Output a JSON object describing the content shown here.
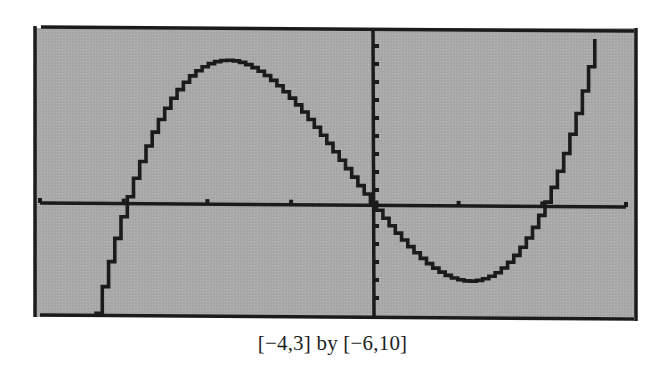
{
  "caption": "[−4,3] by [−6,10]",
  "colors": {
    "screen_bg": "#a9a9a9",
    "ink": "#1b1b1b",
    "page_bg": "#ffffff"
  },
  "chart_data": {
    "type": "line",
    "title": "",
    "caption": "[−4,3] by [−6,10]",
    "function": "y = x^3 + x^2 - 6x",
    "xlabel": "",
    "ylabel": "",
    "xlim": [
      -4,
      3
    ],
    "ylim": [
      -6,
      10
    ],
    "xscale_ticks": [
      -4,
      -3,
      -2,
      -1,
      0,
      1,
      2,
      3
    ],
    "yscale_ticks": [
      -6,
      -5,
      -4,
      -3,
      -2,
      -1,
      0,
      1,
      2,
      3,
      4,
      5,
      6,
      7,
      8,
      9,
      10
    ],
    "tick_labels_shown": false,
    "grid": false,
    "legend": null,
    "features": {
      "x_intercepts": [
        -3,
        0,
        2
      ],
      "local_max": {
        "x": -1.79,
        "y": 8.21
      },
      "local_min": {
        "x": 1.12,
        "y": -4.06
      }
    },
    "series": [
      {
        "name": "f(x)",
        "x": [
          -3.34,
          -3.0,
          -2.5,
          -2.0,
          -1.79,
          -1.5,
          -1.0,
          -0.5,
          0.0,
          0.5,
          1.0,
          1.12,
          1.5,
          2.0,
          2.5,
          2.66
        ],
        "y": [
          -6.06,
          0.0,
          5.63,
          8.0,
          8.21,
          7.88,
          6.0,
          3.13,
          0.0,
          -2.63,
          -4.0,
          -4.06,
          -3.38,
          0.0,
          5.88,
          9.94
        ]
      }
    ]
  }
}
